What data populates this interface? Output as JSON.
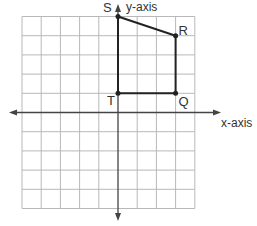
{
  "diagram": {
    "type": "coordinate-grid",
    "grid": {
      "x_min": -5,
      "x_max": 4,
      "y_min": -5,
      "y_max": 5,
      "step": 1
    },
    "axes": {
      "x_label": "x-axis",
      "y_label": "y-axis"
    },
    "polygon": {
      "vertices": [
        {
          "name": "S",
          "x": 0,
          "y": 5
        },
        {
          "name": "R",
          "x": 3,
          "y": 4
        },
        {
          "name": "Q",
          "x": 3,
          "y": 1
        },
        {
          "name": "T",
          "x": 0,
          "y": 1
        }
      ]
    },
    "colors": {
      "grid": "#b8b8b8",
      "axis": "#444444",
      "shape": "#222222",
      "text": "#333333"
    }
  }
}
